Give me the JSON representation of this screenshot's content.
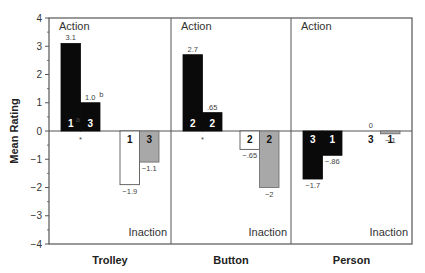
{
  "chart_data": {
    "type": "bar",
    "title": "",
    "xlabel": "",
    "ylabel": "Mean Rating",
    "ylim": [
      -4,
      4
    ],
    "yticks": [
      4,
      3,
      2,
      1,
      0,
      -1,
      -2,
      -3,
      -4
    ],
    "grid": false,
    "panel_top_label": "Action",
    "panel_bottom_label": "Inaction",
    "categories": [
      "Trolley",
      "Button",
      "Person"
    ],
    "panels": [
      {
        "category": "Trolley",
        "action_bars": [
          {
            "value": 3.1,
            "label": "3.1",
            "inner": "1",
            "inner_sup": "a",
            "fill": "black"
          },
          {
            "value": 1.0,
            "label": "1.0",
            "label_sup": "b",
            "inner": "3",
            "fill": "black"
          }
        ],
        "action_marker": "*",
        "inaction_bars": [
          {
            "value": -1.9,
            "label": "−1.9",
            "inner": "1",
            "fill": "white"
          },
          {
            "value": -1.1,
            "label": "−1.1",
            "inner": "3",
            "fill": "grey"
          }
        ]
      },
      {
        "category": "Button",
        "action_bars": [
          {
            "value": 2.7,
            "label": "2.7",
            "inner": "2",
            "fill": "black"
          },
          {
            "value": 0.65,
            "label": ".65",
            "inner": "2",
            "fill": "black"
          }
        ],
        "action_marker": "*",
        "inaction_bars": [
          {
            "value": -0.65,
            "label": "−.65",
            "inner": "2",
            "fill": "white"
          },
          {
            "value": -2.0,
            "label": "−2",
            "inner": "2",
            "fill": "grey"
          }
        ]
      },
      {
        "category": "Person",
        "action_bars": [
          {
            "value": -1.7,
            "label": "−1.7",
            "inner": "3",
            "fill": "black"
          },
          {
            "value": -0.86,
            "label": "−.86",
            "inner": "1",
            "fill": "black"
          }
        ],
        "action_marker": "",
        "inaction_bars": [
          {
            "value": 0,
            "label": "0",
            "inner": "3",
            "fill": "white"
          },
          {
            "value": -0.1,
            "label": "−.1",
            "inner": "1",
            "fill": "grey"
          }
        ]
      }
    ],
    "series": [
      {
        "name": "Action (left pair)",
        "values": [
          [
            3.1,
            1.0
          ],
          [
            2.7,
            0.65
          ],
          [
            -1.7,
            -0.86
          ]
        ]
      },
      {
        "name": "Inaction (right pair)",
        "values": [
          [
            -1.9,
            -1.1
          ],
          [
            -0.65,
            -2.0
          ],
          [
            0,
            -0.1
          ]
        ]
      }
    ]
  },
  "colors": {
    "black": "#0a0a0a",
    "white": "#ffffff",
    "grey": "#a8a8a8",
    "axis": "#555555"
  }
}
